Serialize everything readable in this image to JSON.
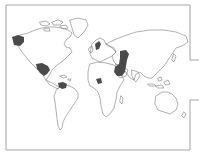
{
  "map": {
    "type": "world outline map",
    "projection": "equirectangular-like",
    "colors": {
      "background": "#ffffff",
      "frame": "#9a9a9a",
      "coastline": "#6e6e6e",
      "highlight": "#4a4a4a"
    },
    "highlighted_regions": [
      {
        "id": "western-north-america",
        "label": "Western North America (Pacific Northwest)"
      },
      {
        "id": "mexico",
        "label": "Mexico / Central America"
      },
      {
        "id": "northern-south-america",
        "label": "Northern South America"
      },
      {
        "id": "scandinavia",
        "label": "Scandinavia"
      },
      {
        "id": "west-central-africa",
        "label": "West-Central Africa"
      },
      {
        "id": "middle-east-central-asia",
        "label": "Middle East / Arabia / Central Asia"
      }
    ]
  }
}
